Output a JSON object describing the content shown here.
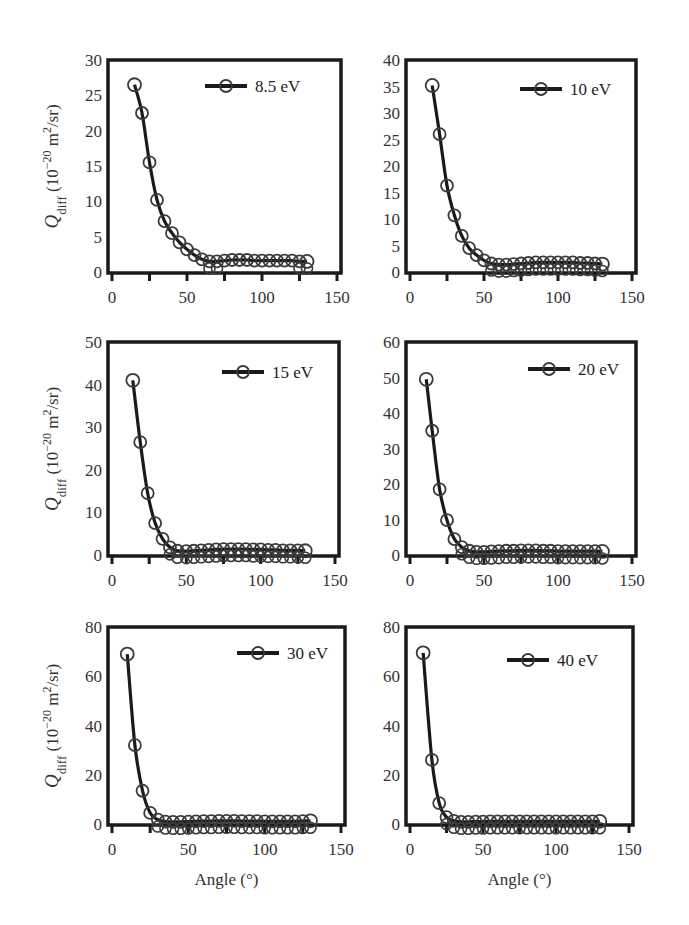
{
  "figure": {
    "xlabel": "Angle (°)",
    "ylabel_main": "Q",
    "ylabel_sub": "diff",
    "ylabel_units": " (10",
    "ylabel_exp": "−20",
    "ylabel_units2": " m",
    "ylabel_sq": "2",
    "ylabel_tail": "/sr)"
  },
  "colors": {
    "line": "#1a1a1a",
    "marker": "#3a3a3a",
    "frame": "#1a1a1a",
    "text": "#333333"
  },
  "chart_data": [
    {
      "type": "line",
      "title": "",
      "legend": "8.5 eV",
      "xlabel": "",
      "ylabel": "Qdiff (10^-20 m^2/sr)",
      "xlim": [
        0,
        150
      ],
      "ylim": [
        0,
        30
      ],
      "xticks": [
        0,
        50,
        100,
        150
      ],
      "yticks": [
        0,
        5,
        10,
        15,
        20,
        25,
        30
      ],
      "x": [
        15,
        20,
        25,
        30,
        35,
        40,
        45,
        50,
        55,
        60,
        65,
        70,
        75,
        80,
        85,
        90,
        95,
        100,
        105,
        110,
        115,
        120,
        125,
        130
      ],
      "values": [
        26.5,
        22.5,
        15.5,
        10.2,
        7.2,
        5.5,
        4.2,
        3.2,
        2.4,
        1.8,
        1.5,
        1.5,
        1.6,
        1.7,
        1.7,
        1.7,
        1.6,
        1.6,
        1.6,
        1.6,
        1.6,
        1.6,
        1.5,
        1.5
      ]
    },
    {
      "type": "line",
      "legend": "10 eV",
      "xlabel": "",
      "ylabel": "",
      "xlim": [
        0,
        150
      ],
      "ylim": [
        0,
        40
      ],
      "xticks": [
        0,
        50,
        100,
        150
      ],
      "yticks": [
        0,
        5,
        10,
        15,
        20,
        25,
        30,
        35,
        40
      ],
      "x": [
        15,
        20,
        25,
        30,
        35,
        40,
        45,
        50,
        55,
        60,
        65,
        70,
        75,
        80,
        85,
        90,
        95,
        100,
        105,
        110,
        115,
        120,
        125,
        130
      ],
      "values": [
        35.2,
        26.0,
        16.3,
        10.7,
        6.8,
        4.5,
        3.2,
        2.2,
        1.6,
        1.4,
        1.4,
        1.5,
        1.6,
        1.7,
        1.8,
        1.8,
        1.8,
        1.8,
        1.8,
        1.8,
        1.7,
        1.7,
        1.6,
        1.5
      ]
    },
    {
      "type": "line",
      "legend": "15 eV",
      "xlabel": "",
      "ylabel": "Qdiff (10^-20 m^2/sr)",
      "xlim": [
        0,
        150
      ],
      "ylim": [
        0,
        50
      ],
      "xticks": [
        0,
        50,
        100,
        150
      ],
      "yticks": [
        0,
        10,
        20,
        30,
        40,
        50
      ],
      "x": [
        14,
        19,
        24,
        29,
        34,
        39,
        44,
        50,
        55,
        60,
        65,
        70,
        75,
        80,
        85,
        90,
        95,
        100,
        105,
        110,
        115,
        120,
        125,
        130
      ],
      "values": [
        41.0,
        26.5,
        14.5,
        7.5,
        3.8,
        1.8,
        1.0,
        0.9,
        1.0,
        1.1,
        1.2,
        1.3,
        1.4,
        1.4,
        1.4,
        1.4,
        1.3,
        1.3,
        1.2,
        1.2,
        1.1,
        1.1,
        1.1,
        1.0
      ]
    },
    {
      "type": "line",
      "legend": "20 eV",
      "xlabel": "",
      "ylabel": "",
      "xlim": [
        0,
        150
      ],
      "ylim": [
        0,
        60
      ],
      "xticks": [
        0,
        50,
        100,
        150
      ],
      "yticks": [
        0,
        10,
        20,
        30,
        40,
        50,
        60
      ],
      "x": [
        11,
        15,
        20,
        25,
        30,
        35,
        40,
        45,
        50,
        55,
        60,
        65,
        70,
        75,
        80,
        85,
        90,
        95,
        100,
        105,
        110,
        115,
        120,
        125,
        130
      ],
      "values": [
        49.5,
        35.0,
        18.5,
        9.8,
        4.5,
        2.2,
        1.2,
        0.9,
        0.9,
        1.0,
        1.1,
        1.2,
        1.2,
        1.3,
        1.3,
        1.3,
        1.2,
        1.2,
        1.1,
        1.1,
        1.1,
        1.1,
        1.1,
        1.1,
        1.0
      ]
    },
    {
      "type": "line",
      "legend": "30 eV",
      "xlabel": "Angle (°)",
      "ylabel": "Qdiff (10^-20 m^2/sr)",
      "xlim": [
        0,
        150
      ],
      "ylim": [
        0,
        80
      ],
      "xticks": [
        0,
        50,
        100,
        150
      ],
      "yticks": [
        0,
        20,
        40,
        60,
        80
      ],
      "x": [
        10,
        15,
        20,
        25,
        30,
        35,
        40,
        45,
        50,
        55,
        60,
        65,
        70,
        75,
        80,
        85,
        90,
        95,
        100,
        105,
        110,
        115,
        120,
        125,
        130
      ],
      "values": [
        69.0,
        32.0,
        13.5,
        4.5,
        1.8,
        1.0,
        0.9,
        0.9,
        1.0,
        1.1,
        1.2,
        1.2,
        1.3,
        1.3,
        1.3,
        1.2,
        1.2,
        1.2,
        1.1,
        1.1,
        1.1,
        1.1,
        1.1,
        1.2,
        1.3
      ]
    },
    {
      "type": "line",
      "legend": "40 eV",
      "xlabel": "Angle (°)",
      "ylabel": "",
      "xlim": [
        0,
        150
      ],
      "ylim": [
        0,
        80
      ],
      "xticks": [
        0,
        50,
        100,
        150
      ],
      "yticks": [
        0,
        20,
        40,
        60,
        80
      ],
      "x": [
        9,
        15,
        20,
        25,
        30,
        35,
        40,
        45,
        50,
        55,
        60,
        65,
        70,
        75,
        80,
        85,
        90,
        95,
        100,
        105,
        110,
        115,
        120,
        125,
        130
      ],
      "values": [
        69.5,
        26.0,
        8.5,
        2.8,
        1.3,
        0.9,
        0.9,
        1.0,
        1.0,
        1.1,
        1.1,
        1.1,
        1.1,
        1.1,
        1.1,
        1.1,
        1.1,
        1.1,
        1.1,
        1.1,
        1.1,
        1.1,
        1.1,
        1.1,
        1.1
      ]
    }
  ]
}
